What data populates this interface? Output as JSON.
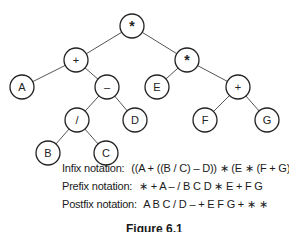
{
  "tree": {
    "nodes": [
      {
        "id": "root",
        "label": "*",
        "x": 132,
        "y": 26
      },
      {
        "id": "plus1",
        "label": "+",
        "x": 76,
        "y": 60
      },
      {
        "id": "mul2",
        "label": "*",
        "x": 187,
        "y": 60
      },
      {
        "id": "A",
        "label": "A",
        "x": 22,
        "y": 87
      },
      {
        "id": "minus",
        "label": "–",
        "x": 107,
        "y": 87
      },
      {
        "id": "E",
        "label": "E",
        "x": 157,
        "y": 87
      },
      {
        "id": "plus2",
        "label": "+",
        "x": 238,
        "y": 87
      },
      {
        "id": "div",
        "label": "/",
        "x": 77,
        "y": 120
      },
      {
        "id": "D",
        "label": "D",
        "x": 135,
        "y": 120
      },
      {
        "id": "F",
        "label": "F",
        "x": 205,
        "y": 120
      },
      {
        "id": "G",
        "label": "G",
        "x": 267,
        "y": 120
      },
      {
        "id": "B",
        "label": "B",
        "x": 48,
        "y": 153
      },
      {
        "id": "C",
        "label": "C",
        "x": 106,
        "y": 153
      }
    ],
    "edges": [
      [
        "root",
        "plus1"
      ],
      [
        "root",
        "mul2"
      ],
      [
        "plus1",
        "A"
      ],
      [
        "plus1",
        "minus"
      ],
      [
        "mul2",
        "E"
      ],
      [
        "mul2",
        "plus2"
      ],
      [
        "minus",
        "div"
      ],
      [
        "minus",
        "D"
      ],
      [
        "plus2",
        "F"
      ],
      [
        "plus2",
        "G"
      ],
      [
        "div",
        "B"
      ],
      [
        "div",
        "C"
      ]
    ],
    "node_radius": 12
  },
  "notations": {
    "infix": {
      "label": "Infix notation:",
      "value": "((A + ((B / C) – D)) ∗ (E ∗ (F + G)))"
    },
    "prefix": {
      "label": "Prefix notation:",
      "value": "∗ + A – / B C D ∗ E + F G"
    },
    "postfix": {
      "label": "Postfix notation:",
      "value": "A B C / D – + E F G + ∗ ∗"
    }
  },
  "caption": "Figure 6.1"
}
